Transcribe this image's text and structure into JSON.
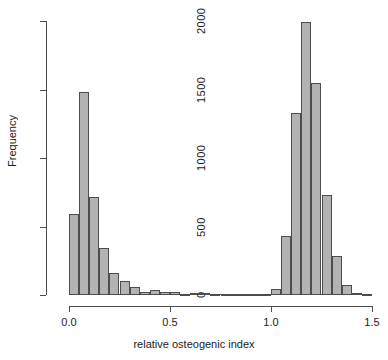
{
  "chart_data": {
    "type": "bar",
    "title": "",
    "subtitle": "",
    "xlabel": "relative osteogenic index",
    "ylabel": "Frequency",
    "xlim": [
      0.0,
      1.5
    ],
    "ylim": [
      0,
      2000
    ],
    "grid": false,
    "legend": null,
    "bin_width": 0.05,
    "x_ticks": [
      "0.0",
      "0.5",
      "1.0",
      "1.5"
    ],
    "x_tick_values": [
      0.0,
      0.5,
      1.0,
      1.5
    ],
    "y_ticks": [
      "0",
      "500",
      "1000",
      "1500",
      "2000"
    ],
    "y_tick_values": [
      0,
      500,
      1000,
      1500,
      2000
    ],
    "bin_starts": [
      0.0,
      0.05,
      0.1,
      0.15,
      0.2,
      0.25,
      0.3,
      0.35,
      0.4,
      0.45,
      0.5,
      0.55,
      0.6,
      0.65,
      0.7,
      0.75,
      0.8,
      0.85,
      0.9,
      0.95,
      1.0,
      1.05,
      1.1,
      1.15,
      1.2,
      1.25,
      1.3,
      1.35,
      1.4,
      1.45
    ],
    "categories": [
      "0.00-0.05",
      "0.05-0.10",
      "0.10-0.15",
      "0.15-0.20",
      "0.20-0.25",
      "0.25-0.30",
      "0.30-0.35",
      "0.35-0.40",
      "0.40-0.45",
      "0.45-0.50",
      "0.50-0.55",
      "0.55-0.60",
      "0.60-0.65",
      "0.65-0.70",
      "0.70-0.75",
      "0.75-0.80",
      "0.80-0.85",
      "0.85-0.90",
      "0.90-0.95",
      "0.95-1.00",
      "1.00-1.05",
      "1.05-1.10",
      "1.10-1.15",
      "1.15-1.20",
      "1.20-1.25",
      "1.25-1.30",
      "1.30-1.35",
      "1.35-1.40",
      "1.40-1.45",
      "1.45-1.50"
    ],
    "values": [
      590,
      1485,
      715,
      340,
      160,
      105,
      55,
      20,
      40,
      25,
      20,
      10,
      15,
      15,
      10,
      5,
      5,
      5,
      5,
      5,
      45,
      430,
      1330,
      1990,
      1545,
      730,
      285,
      75,
      15,
      5
    ],
    "bar_fill_color": "#b3b3b3",
    "bar_edge_color": "#4d4d4d"
  },
  "axis": {
    "y_label": "Frequency",
    "x_label": "relative osteogenic index"
  }
}
